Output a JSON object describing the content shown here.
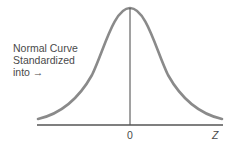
{
  "caption": {
    "lines": [
      "Normal Curve",
      "Standardized",
      "into →"
    ]
  },
  "axis": {
    "origin_label": "0",
    "variable_label": "Z"
  },
  "colors": {
    "curve": "#8a8a8a",
    "axis": "#555555",
    "text": "#4a4a4a"
  }
}
